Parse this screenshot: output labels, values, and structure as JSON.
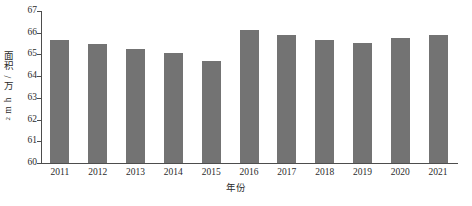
{
  "chart_data": {
    "type": "bar",
    "title": "",
    "xlabel": "年份",
    "ylabel": "面积/万 hm²",
    "ylabel_parts": {
      "text": "面积/万 hm",
      "superscript": "2"
    },
    "categories": [
      "2011",
      "2012",
      "2013",
      "2014",
      "2015",
      "2016",
      "2017",
      "2018",
      "2019",
      "2020",
      "2021"
    ],
    "values": [
      65.68,
      65.48,
      65.25,
      65.07,
      64.7,
      66.11,
      65.91,
      65.67,
      65.53,
      65.74,
      65.91
    ],
    "ylim": [
      60,
      67
    ],
    "yticks": [
      60,
      61,
      62,
      63,
      64,
      65,
      66,
      67
    ],
    "ytick_labels": [
      "60",
      "61",
      "62",
      "63",
      "64",
      "65",
      "66",
      "67"
    ],
    "grid": false,
    "legend": null,
    "series_name": "面积",
    "bar_color": "#737373",
    "axis_color": "#4d4d4d",
    "text_color": "#2b2b2b",
    "background_color": "#ffffff"
  }
}
